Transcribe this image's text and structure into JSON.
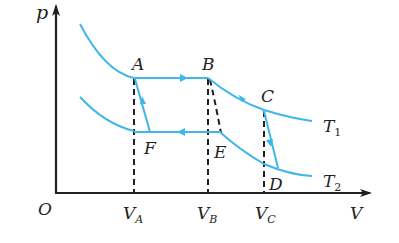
{
  "diagram": {
    "type": "p-V diagram",
    "axes": {
      "y_label": "p",
      "x_label": "V",
      "origin_label": "O"
    },
    "points": [
      {
        "id": "A",
        "label": "A"
      },
      {
        "id": "B",
        "label": "B"
      },
      {
        "id": "C",
        "label": "C"
      },
      {
        "id": "D",
        "label": "D"
      },
      {
        "id": "E",
        "label": "E"
      },
      {
        "id": "F",
        "label": "F"
      }
    ],
    "isotherms": [
      {
        "label": "T",
        "subscript": "1"
      },
      {
        "label": "T",
        "subscript": "2"
      }
    ],
    "volume_ticks": [
      {
        "label": "V",
        "subscript": "A"
      },
      {
        "label": "V",
        "subscript": "B"
      },
      {
        "label": "V",
        "subscript": "C"
      }
    ],
    "colors": {
      "curve": "#3fb7e8",
      "axis": "#231f20",
      "dashed": "#231f20"
    }
  }
}
